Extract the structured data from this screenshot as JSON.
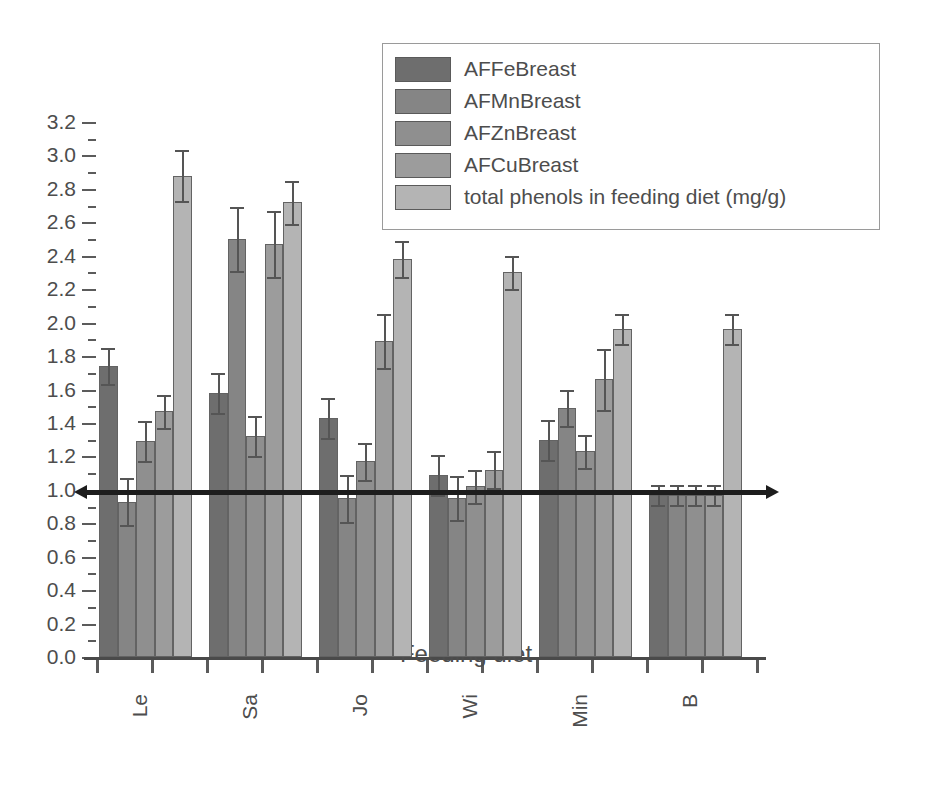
{
  "chart_data": {
    "type": "bar",
    "title": "",
    "xlabel": "Feeding diet",
    "ylabel": "",
    "ylim": [
      0.0,
      3.2
    ],
    "ytick_step": 0.2,
    "grid": false,
    "legend_position": "top-center",
    "reference_line": 1.0,
    "categories": [
      "Le",
      "Sa",
      "Jo",
      "Wi",
      "Min",
      "B"
    ],
    "ytick_labels": [
      "0.0",
      "0.2",
      "0.4",
      "0.6",
      "0.8",
      "1.0",
      "1.2",
      "1.4",
      "1.6",
      "1.8",
      "2.0",
      "2.2",
      "2.4",
      "2.6",
      "2.8",
      "3.0",
      "3.2"
    ],
    "series": [
      {
        "name": "AFFeBreast",
        "color": "#6e6e6e",
        "values": [
          1.74,
          1.58,
          1.43,
          1.09,
          1.3,
          0.97
        ],
        "errors": [
          0.11,
          0.12,
          0.12,
          0.12,
          0.12,
          0.06
        ]
      },
      {
        "name": "AFMnBreast",
        "color": "#858585",
        "values": [
          0.93,
          2.5,
          0.95,
          0.95,
          1.49,
          0.97
        ],
        "errors": [
          0.14,
          0.19,
          0.14,
          0.13,
          0.11,
          0.06
        ]
      },
      {
        "name": "AFZnBreast",
        "color": "#8f8f8f",
        "values": [
          1.29,
          1.32,
          1.17,
          1.02,
          1.23,
          0.97
        ],
        "errors": [
          0.12,
          0.12,
          0.11,
          0.1,
          0.1,
          0.06
        ]
      },
      {
        "name": "AFCuBreast",
        "color": "#9c9c9c",
        "values": [
          1.47,
          2.47,
          1.89,
          1.12,
          1.66,
          0.97
        ],
        "errors": [
          0.1,
          0.2,
          0.16,
          0.11,
          0.18,
          0.06
        ]
      },
      {
        "name": "total phenols in feeding diet (mg/g)",
        "color": "#b4b4b4",
        "values": [
          2.88,
          2.72,
          2.38,
          2.3,
          1.96,
          1.96
        ]
      }
    ],
    "series_errors_last": [
      0.15,
      0.13,
      0.11,
      0.1,
      0.09,
      0.09
    ]
  },
  "legend": {
    "items": [
      {
        "label": "AFFeBreast"
      },
      {
        "label": "AFMnBreast"
      },
      {
        "label": "AFZnBreast"
      },
      {
        "label": "AFCuBreast"
      },
      {
        "label": "total phenols in feeding diet (mg/g)"
      }
    ]
  },
  "axis": {
    "x_title": "Feeding diet"
  }
}
